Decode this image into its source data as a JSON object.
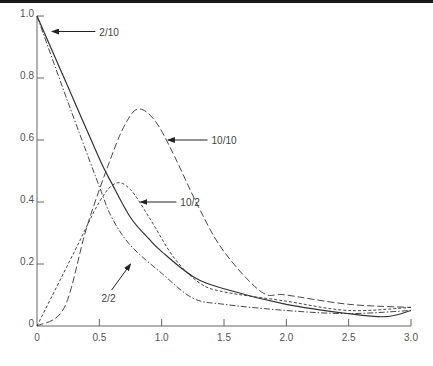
{
  "chart_data": {
    "type": "line",
    "title": "",
    "xlabel": "",
    "ylabel": "",
    "xlim": [
      0,
      3.0
    ],
    "ylim": [
      0,
      1.0
    ],
    "grid": false,
    "legend": "none (inline arrow annotations)",
    "x_ticks": [
      "0",
      "0.5",
      "1.0",
      "1.5",
      "2.0",
      "2.5",
      "3.0"
    ],
    "y_ticks": [
      "0",
      "0.2",
      "0.4",
      "0.6",
      "0.8",
      "1.0"
    ],
    "series": [
      {
        "name": "2/10",
        "style": "solid",
        "x": [
          0,
          0.25,
          0.5,
          0.6,
          0.75,
          0.9,
          1.0,
          1.25,
          1.5,
          2.0,
          2.5,
          2.8,
          3.0
        ],
        "y": [
          1.0,
          0.77,
          0.54,
          0.46,
          0.35,
          0.28,
          0.24,
          0.16,
          0.12,
          0.07,
          0.04,
          0.03,
          0.05
        ]
      },
      {
        "name": "2/2",
        "style": "dash-dot",
        "x": [
          0,
          0.25,
          0.5,
          0.6,
          0.75,
          1.0,
          1.25,
          1.5,
          2.0,
          2.5,
          3.0
        ],
        "y": [
          1.0,
          0.72,
          0.45,
          0.35,
          0.26,
          0.17,
          0.09,
          0.07,
          0.05,
          0.04,
          0.05
        ]
      },
      {
        "name": "10/10",
        "style": "long-dash",
        "x": [
          0,
          0.22,
          0.4,
          0.6,
          0.72,
          0.82,
          0.95,
          1.1,
          1.3,
          1.5,
          1.8,
          2.0,
          2.5,
          3.0
        ],
        "y": [
          0,
          0.06,
          0.32,
          0.55,
          0.66,
          0.7,
          0.66,
          0.55,
          0.38,
          0.24,
          0.11,
          0.1,
          0.07,
          0.06
        ]
      },
      {
        "name": "10/2",
        "style": "short-dash",
        "x": [
          0,
          0.3,
          0.5,
          0.63,
          0.75,
          0.9,
          1.1,
          1.3,
          1.5,
          2.0,
          2.5,
          3.0
        ],
        "y": [
          0,
          0.24,
          0.4,
          0.46,
          0.44,
          0.35,
          0.22,
          0.14,
          0.11,
          0.08,
          0.05,
          0.06
        ]
      }
    ],
    "annotations": [
      {
        "text": "2/10",
        "arrow_to": [
          0.12,
          0.95
        ],
        "label_at": [
          0.5,
          0.95
        ]
      },
      {
        "text": "10/10",
        "arrow_to": [
          1.05,
          0.6
        ],
        "label_at": [
          1.4,
          0.6
        ]
      },
      {
        "text": "10/2",
        "arrow_to": [
          0.83,
          0.4
        ],
        "label_at": [
          1.15,
          0.4
        ]
      },
      {
        "text": "2/2",
        "arrow_to": [
          0.75,
          0.2
        ],
        "label_at": [
          0.55,
          0.09
        ]
      }
    ]
  },
  "colors": {
    "line": "#333333",
    "axis": "#666666",
    "text": "#555555",
    "background": "#ffffff"
  }
}
